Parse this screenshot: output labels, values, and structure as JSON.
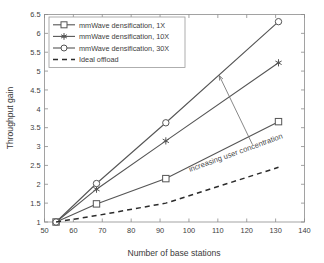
{
  "chart_data": {
    "type": "line",
    "title": "",
    "xlabel": "Number of base stations",
    "ylabel": "Throughput gain",
    "xlim": [
      50,
      140
    ],
    "ylim": [
      1,
      6.5
    ],
    "xticks": [
      50,
      60,
      70,
      80,
      90,
      100,
      110,
      120,
      130,
      140
    ],
    "yticks": [
      1,
      1.5,
      2,
      2.5,
      3,
      3.5,
      4,
      4.5,
      5,
      5.5,
      6,
      6.5
    ],
    "xtick_labels": [
      "50",
      "60",
      "70",
      "80",
      "90",
      "100",
      "110",
      "120",
      "130",
      "140"
    ],
    "ytick_labels": [
      "1",
      "1.5",
      "2",
      "2.5",
      "3",
      "3.5",
      "4",
      "4.5",
      "5",
      "5.5",
      "6",
      "6.5"
    ],
    "grid": false,
    "legend_position": "upper left",
    "x": [
      54,
      68,
      92,
      131
    ],
    "series": [
      {
        "name": "mmWave densification, 1X",
        "marker": "open-square",
        "linestyle": "solid",
        "values": [
          1.0,
          1.48,
          2.15,
          3.66
        ]
      },
      {
        "name": "mmWave densification, 10X",
        "marker": "filled-star",
        "linestyle": "solid",
        "values": [
          1.0,
          1.87,
          3.15,
          5.22
        ]
      },
      {
        "name": "mmWave densification, 30X",
        "marker": "open-circle",
        "linestyle": "solid",
        "values": [
          1.0,
          2.02,
          3.63,
          6.31
        ]
      },
      {
        "name": "Ideal offload",
        "marker": "none",
        "linestyle": "dashed",
        "values": [
          1.0,
          1.17,
          1.5,
          2.45
        ]
      }
    ],
    "annotations": [
      {
        "text": "increasing user concentration",
        "rotation": -20,
        "arrow_from": [
          122,
          3.05
        ],
        "arrow_to": [
          110.5,
          4.88
        ]
      }
    ],
    "colors": {
      "line": "#555555",
      "dashed_line": "#2b2b2b",
      "axis": "#8c8c8c",
      "text": "#3d3d3d",
      "background": "#ffffff"
    }
  },
  "legend": {
    "entries": [
      {
        "label": "mmWave densification, 1X"
      },
      {
        "label": "mmWave densification, 10X"
      },
      {
        "label": "mmWave densification, 30X"
      },
      {
        "label": "Ideal offload"
      }
    ]
  },
  "axes": {
    "x_title": "Number of base stations",
    "y_title": "Throughput gain"
  }
}
